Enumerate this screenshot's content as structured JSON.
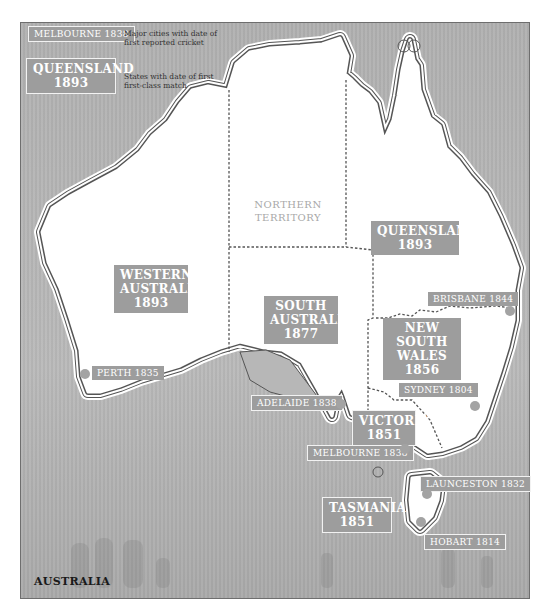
{
  "legend": {
    "city_sample": "MELBOURNE 1838",
    "city_desc_line1": "Major cities with date of",
    "city_desc_line2": "first reported cricket",
    "state_sample_name": "QUEENSLAND",
    "state_sample_year": "1893",
    "state_desc_line1": "States with date of first",
    "state_desc_line2": "first-class match"
  },
  "territory": {
    "line1": "NORTHERN",
    "line2": "TERRITORY"
  },
  "states": [
    {
      "name_line1": "WESTERN",
      "name_line2": "AUSTRALIA",
      "year": "1893"
    },
    {
      "name_line1": "SOUTH",
      "name_line2": "AUSTRALIA",
      "year": "1877"
    },
    {
      "name_line1": "QUEENSLAND",
      "name_line2": "",
      "year": "1893"
    },
    {
      "name_line1": "NEW SOUTH",
      "name_line2": "WALES",
      "year": "1856"
    },
    {
      "name_line1": "VICTORIA",
      "name_line2": "",
      "year": "1851"
    },
    {
      "name_line1": "TASMANIA",
      "name_line2": "",
      "year": "1851"
    }
  ],
  "cities": [
    {
      "label": "PERTH 1835"
    },
    {
      "label": "ADELAIDE 1838"
    },
    {
      "label": "MELBOURNE 1838"
    },
    {
      "label": "SYDNEY 1804"
    },
    {
      "label": "BRISBANE 1844"
    },
    {
      "label": "LAUNCESTON 1832"
    },
    {
      "label": "HOBART 1814"
    }
  ],
  "country_label": "AUSTRALIA",
  "colors": {
    "sea": "#b7b7b7",
    "land": "#ffffff",
    "label_box": "#9d9d9d",
    "city_dot": "#a3a3a3"
  }
}
